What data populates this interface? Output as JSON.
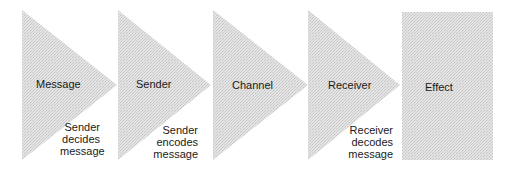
{
  "diagram": {
    "fill_color": "#dcdcdc",
    "stages": [
      {
        "label": "Message",
        "note": [
          "Sender",
          "decides",
          "message"
        ]
      },
      {
        "label": "Sender",
        "note": [
          "Sender",
          "encodes",
          "message"
        ]
      },
      {
        "label": "Channel",
        "note": []
      },
      {
        "label": "Receiver",
        "note": [
          "Receiver",
          "decodes",
          "message"
        ]
      },
      {
        "label": "Effect",
        "note": []
      }
    ]
  }
}
